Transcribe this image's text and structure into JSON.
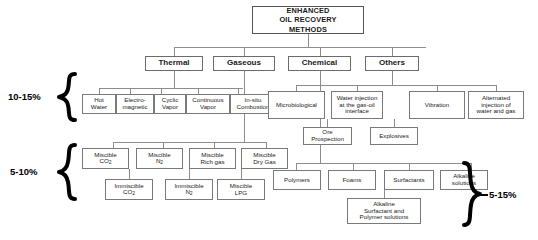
{
  "diagram": {
    "background": "#ffffff",
    "line_color": "#8d8d8d",
    "box_border": "#7a7a7a",
    "root": {
      "label": "ENHANCED\nOIL RECOVERY\nMETHODS",
      "line1": "ENHANCED",
      "line2": "OIL RECOVERY",
      "line3": "METHODS"
    },
    "categories": {
      "thermal": "Thermal",
      "gaseous": "Gaseous",
      "chemical": "Chemical",
      "others": "Others"
    },
    "thermal_children": [
      {
        "line1": "Hot",
        "line2": "Water"
      },
      {
        "line1": "Electro-",
        "line2": "magnetic"
      },
      {
        "line1": "Cyclic",
        "line2": "Vapor"
      },
      {
        "line1": "Continuous",
        "line2": "Vapor"
      },
      {
        "line1": "In-situ",
        "line2": "Combustion"
      }
    ],
    "others_children": [
      {
        "line1": "Microbiological",
        "line2": "",
        "line3": ""
      },
      {
        "line1": "Water injection",
        "line2": "at the gas-oil",
        "line3": "interface"
      },
      {
        "line1": "Vibration",
        "line2": "",
        "line3": ""
      },
      {
        "line1": "Alternated",
        "line2": "injection of",
        "line3": "water and gas"
      }
    ],
    "others_subchildren": [
      {
        "line1": "Ore",
        "line2": "Prospection"
      },
      {
        "line1": "Explosives",
        "line2": ""
      }
    ],
    "gaseous_children_top": [
      {
        "line1": "Miscible",
        "line2": "CO",
        "sub": "2"
      },
      {
        "line1": "Miscible",
        "line2": "N",
        "sub": "2"
      },
      {
        "line1": "Miscible",
        "line2": "Rich gas",
        "sub": ""
      },
      {
        "line1": "Miscible",
        "line2": "Dry Gas",
        "sub": ""
      }
    ],
    "gaseous_children_bottom": [
      {
        "line1": "Immiscible",
        "line2": "CO",
        "sub": "2"
      },
      {
        "line1": "Immiscible",
        "line2": "N",
        "sub": "2"
      },
      {
        "line1": "Miscible",
        "line2": "LPG",
        "sub": ""
      }
    ],
    "chemical_children": [
      {
        "line1": "Polymers",
        "line2": ""
      },
      {
        "line1": "Foams",
        "line2": ""
      },
      {
        "line1": "Surfactants",
        "line2": ""
      },
      {
        "line1": "Alkaline",
        "line2": "solutions"
      }
    ],
    "chemical_subchild": {
      "line1": "Alkaline",
      "line2": "Surfactant and",
      "line3": "Polymer solutions"
    },
    "annotations": {
      "thermal_recovery_pct": "10-15%",
      "gaseous_recovery_pct": "5-10%",
      "chemical_recovery_pct": "5-15%"
    }
  }
}
